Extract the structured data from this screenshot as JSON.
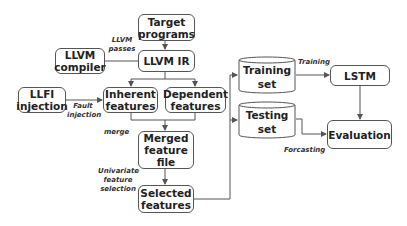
{
  "nodes": {
    "target_programs": "Target programs",
    "llvm_ir": "LLVM IR",
    "llvm_compiler": "LLVM compiler",
    "llfi_injection": "LLFI injection",
    "inherent_features": "Inherent features",
    "dependent_features": "Dependent features",
    "merged_feature_file": "Merged feature file",
    "selected_features": "Selected features",
    "training_set": "Training set",
    "testing_set": "Testing set",
    "lstm": "LSTM",
    "evaluation": "Evaluation"
  },
  "edge_labels": {
    "llvm_passes": "LLVM passes",
    "fault_injection": "Fault injection",
    "merge": "merge",
    "univariate_feature_selection": "Univariate feature selection",
    "training": "Training",
    "forcasting": "Forcasting"
  },
  "colors": {
    "stroke": "#555555",
    "text": "#222222",
    "background": "#ffffff"
  }
}
